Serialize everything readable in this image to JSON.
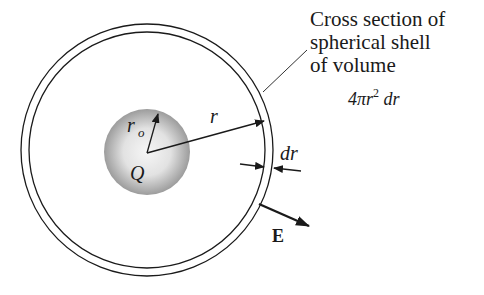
{
  "figure": {
    "caption_lines": [
      "Cross section of",
      "spherical shell",
      "of volume"
    ],
    "volume_formula": {
      "prefix": "4πr",
      "exponent": "2",
      "suffix": " dr"
    },
    "labels": {
      "radius": "r",
      "core_radius_main": "r",
      "core_radius_sub": "o",
      "charge": "Q",
      "shell_thickness": "dr",
      "field": "E"
    },
    "colors": {
      "line": "#1a1a1a",
      "sphere_center": "#f4f4f4",
      "sphere_edge": "#9a9a9a",
      "background": "#ffffff"
    }
  }
}
